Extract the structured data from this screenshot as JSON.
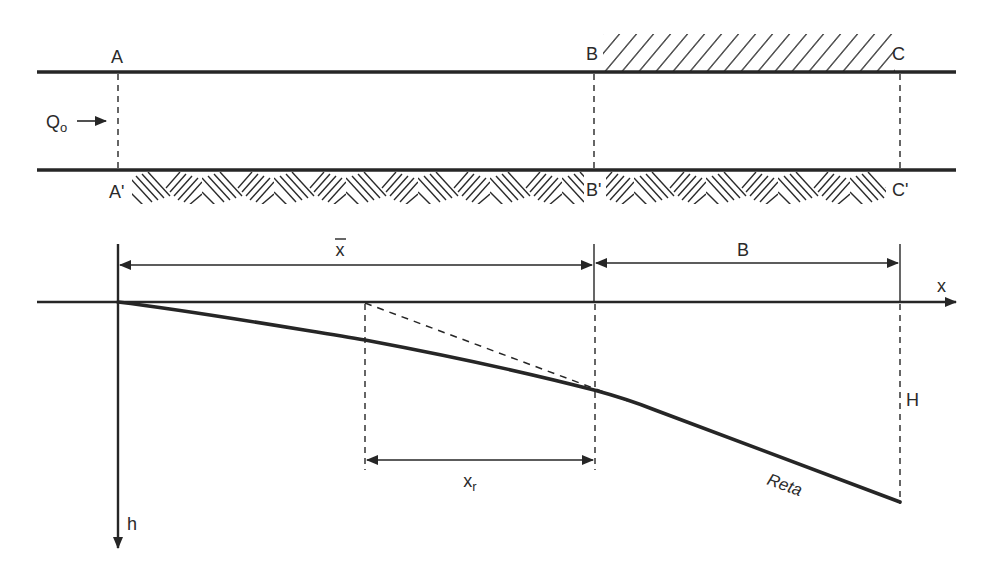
{
  "colors": {
    "ink": "#262626",
    "background": "#ffffff"
  },
  "plan_view": {
    "section_labels": {
      "A": "A",
      "A_prime": "A'",
      "B": "B",
      "B_prime": "B'",
      "C": "C",
      "C_prime": "C'"
    },
    "inflow": {
      "symbol": "Q",
      "subscript": "o"
    }
  },
  "profile_view": {
    "dimension_xbar": "x",
    "dimension_B": "B",
    "axis_x": "x",
    "axis_h": "h",
    "dimension_xr": "x",
    "dimension_xr_subscript": "r",
    "label_H": "H",
    "label_reta": "Reta"
  }
}
